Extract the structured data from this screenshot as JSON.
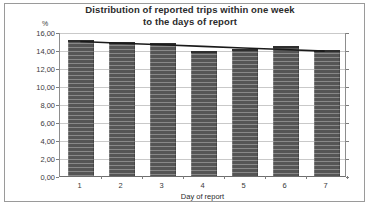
{
  "chart_data": {
    "type": "bar",
    "title": "Distribution of reported trips within one week to the days of report",
    "title_lines": [
      "Distribution of reported trips within one week",
      "to the days of report"
    ],
    "xlabel": "Day of report",
    "ylabel": "%",
    "categories": [
      "1",
      "2",
      "3",
      "4",
      "5",
      "6",
      "7"
    ],
    "values": [
      15.1,
      14.9,
      14.8,
      13.9,
      14.1,
      14.5,
      14.0
    ],
    "ylim": [
      0,
      16
    ],
    "ytick_step": 2,
    "ytick_labels": [
      "16,00",
      "14,00",
      "12,00",
      "10,00",
      "8,00",
      "6,00",
      "4,00",
      "2,00",
      "0,00"
    ],
    "ytick_values": [
      16,
      14,
      12,
      10,
      8,
      6,
      4,
      2,
      0
    ],
    "grid": true,
    "legend": "none",
    "decimal_separator": ",",
    "series": [
      {
        "name": "Share of reported trips",
        "type": "bar",
        "color": "#555555",
        "values": [
          15.1,
          14.9,
          14.8,
          13.9,
          14.1,
          14.5,
          14.0
        ]
      },
      {
        "name": "Trend",
        "type": "line",
        "color": "#1a1a1a",
        "values": [
          15.05,
          14.85,
          14.68,
          14.5,
          14.32,
          14.15,
          13.97
        ]
      }
    ]
  }
}
